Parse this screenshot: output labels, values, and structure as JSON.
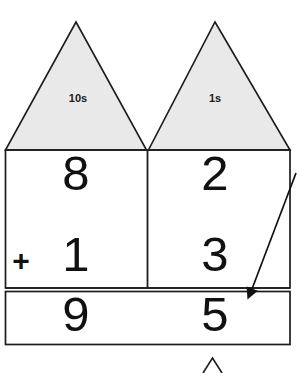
{
  "worksheet": {
    "title": "Place value column addition",
    "colors": {
      "triangle_fill": "#e9e9e9",
      "line": "#1c1c1c",
      "digit": "#111111",
      "background": "#ffffff"
    },
    "columns": [
      {
        "id": "tens",
        "place_label": "10s"
      },
      {
        "id": "ones",
        "place_label": "1s"
      }
    ],
    "operator": "+",
    "rows": [
      {
        "id": "addend-1",
        "tens": "8",
        "ones": "2"
      },
      {
        "id": "addend-2",
        "tens": "1",
        "ones": "3"
      },
      {
        "id": "sum",
        "tens": "9",
        "ones": "5"
      }
    ],
    "annotations": [
      {
        "id": "pointer-arrow",
        "name": "answer-pointer-arrow",
        "target": "sum-ones-cell"
      },
      {
        "id": "bottom-caret",
        "name": "partial-triangle-caret"
      }
    ]
  }
}
